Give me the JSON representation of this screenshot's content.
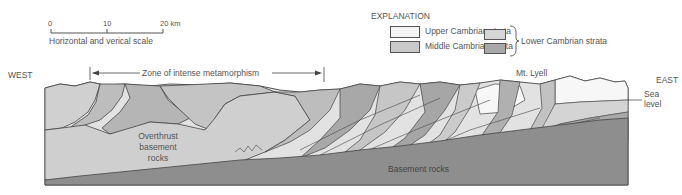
{
  "scale_bar": {
    "ticks": [
      "0",
      "10",
      "20 km"
    ],
    "label": "Horizontal and verical scale"
  },
  "explanation": {
    "title": "EXPLANATION",
    "items": [
      {
        "label": "Upper Cambrian strata",
        "color": "#f4f4f4"
      },
      {
        "label": "Middle Cambrian strata",
        "color": "#c9c9c9"
      }
    ],
    "lower_group": {
      "label": "Lower Cambrian strata",
      "swatches": [
        "#d6d6d6",
        "#a9a9a9"
      ]
    }
  },
  "section": {
    "west_label": "WEST",
    "east_label": "EAST",
    "zone_label": "Zone of intense metamorphism",
    "peak_label": "Mt. Lyell",
    "sea_level_label": [
      "Sea",
      "level"
    ],
    "overthrust_label": [
      "Overthrust",
      "basement",
      "rocks"
    ],
    "basement_label": "Basement rocks"
  },
  "colors": {
    "basement": "#8e8e8e",
    "overthrust": "#cfcfcf",
    "strata_light": "#e2e2e2",
    "strata_mid": "#bdbdbd",
    "strata_dark": "#a4a4a4",
    "upper_white": "#f7f7f7",
    "outline": "#444444"
  }
}
